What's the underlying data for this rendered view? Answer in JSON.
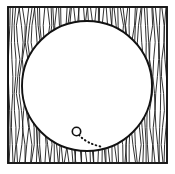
{
  "figure": {
    "kind": "geometry-diagram",
    "caption": "",
    "canvas": {
      "width": 175,
      "height": 174,
      "background": "#ffffff"
    },
    "frame": {
      "label": "hatched square frame",
      "x": 8,
      "y": 7,
      "width": 159,
      "height": 156,
      "stroke_color": "#111111",
      "stroke_width": 1.9,
      "fill_color": "#ffffff"
    },
    "hatching": {
      "label": "vertical wavy shading",
      "orientation": "vertical",
      "line_count": 54,
      "spacing_px": 2.72,
      "wave_amplitude_px": 1.6,
      "stroke_color": "#1a1a1a",
      "stroke_width": 0.9,
      "region": "between square border and circle"
    },
    "circle": {
      "label": "inscribed circle",
      "center_x": 87,
      "center_y": 86,
      "radius": 65,
      "stroke_color": "#111111",
      "stroke_width": 1.9,
      "fill_color": "#ffffff"
    },
    "marker": {
      "label": "small point circle",
      "center_x": 76.5,
      "center_y": 131.5,
      "radius": 4.2,
      "stroke_color": "#111111",
      "stroke_width": 1.6,
      "fill_color": "#ffffff"
    },
    "trail": {
      "label": "dotted motion trail",
      "style": "dotted",
      "dot_spacing_px": 4,
      "stroke_color": "#111111",
      "stroke_width": 2.0,
      "start_x": 79,
      "start_y": 135,
      "control_x": 87,
      "control_y": 144,
      "end_x": 103,
      "end_y": 147
    },
    "colors": {
      "ink": "#111111",
      "hatch": "#1a1a1a",
      "paper": "#ffffff"
    }
  }
}
